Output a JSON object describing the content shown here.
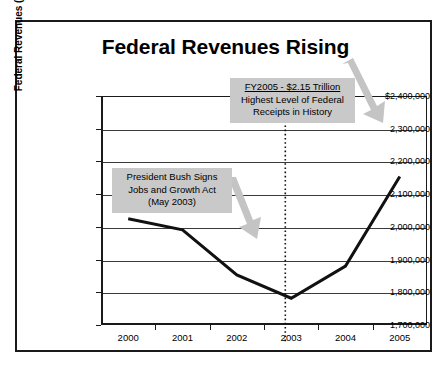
{
  "chart_data": {
    "type": "line",
    "title": "Federal Revenues Rising",
    "xlabel": "",
    "ylabel": "Federal Revenues (in millions)",
    "categories": [
      "2000",
      "2001",
      "2002",
      "2003",
      "2004",
      "2005"
    ],
    "x": [
      2000,
      2001,
      2002,
      2003,
      2004,
      2005
    ],
    "values": [
      2025000,
      1991000,
      1853000,
      1782000,
      1880000,
      2154000
    ],
    "series": [
      {
        "name": "Federal Revenues",
        "values": [
          2025000,
          1991000,
          1853000,
          1782000,
          1880000,
          2154000
        ]
      }
    ],
    "ylim": [
      1700000,
      2400000
    ],
    "ytick_values": [
      2400000,
      2300000,
      2200000,
      2100000,
      2000000,
      1900000,
      1800000,
      1700000
    ],
    "ytick_labels": [
      "$2,400,000",
      "2,300,000",
      "2,200,000",
      "2,100,000",
      "2,000,000",
      "1,900,000",
      "1,800,000",
      "1,700,000"
    ],
    "grid": true,
    "legend": "none",
    "line_color": "#111111",
    "annotations": [
      {
        "id": "fy2005",
        "lines": [
          "FY2005 - $2.15 Trillion",
          "Highest Level of Federal",
          "Receipts in History"
        ],
        "first_line_underlined": true,
        "points_to": "2005 data point",
        "arrow_direction": "down-right"
      },
      {
        "id": "bush-jobs-act",
        "lines": [
          "President Bush Signs",
          "Jobs and Growth Act",
          "(May 2003)"
        ],
        "first_line_underlined": false,
        "points_to": "2003 data point",
        "arrow_direction": "down-right"
      }
    ],
    "marker_line": {
      "axis": "x",
      "value": "2003",
      "style": "dotted",
      "color": "#111111"
    }
  },
  "axis": {
    "y": {
      "title": "Federal Revenues (in millions)",
      "ticks": [
        "$2,400,000",
        "2,300,000",
        "2,200,000",
        "2,100,000",
        "2,000,000",
        "1,900,000",
        "1,800,000",
        "1,700,000"
      ]
    },
    "x": {
      "ticks": [
        "2000",
        "2001",
        "2002",
        "2003",
        "2004",
        "2005"
      ]
    }
  },
  "callouts": {
    "fy2005": {
      "line1": "FY2005 - $2.15 Trillion",
      "line2": "Highest Level of Federal",
      "line3": "Receipts in History"
    },
    "bush": {
      "line1": "President Bush Signs",
      "line2": "Jobs and Growth Act",
      "line3": "(May 2003)"
    }
  },
  "colors": {
    "callout_background": "#c9c9c9",
    "arrow": "#c0c0c0",
    "line": "#111111",
    "frame": "#1a1a1a"
  }
}
